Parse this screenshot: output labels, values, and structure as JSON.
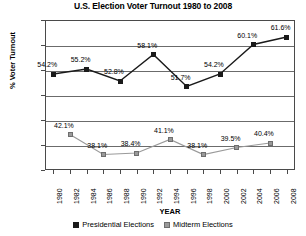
{
  "chart_data": {
    "type": "line",
    "title": "U.S. Election Voter Turnout 1980 to 2008",
    "xlabel": "YEAR",
    "ylabel": "% Voter Turnout",
    "ylim": [
      35,
      65
    ],
    "ytick_step": 5,
    "ytick_labels": [
      "65%",
      "60%",
      "55%",
      "50%",
      "45%",
      "40%",
      "35%"
    ],
    "ytick_values": [
      65,
      60,
      55,
      50,
      45,
      40,
      35
    ],
    "grid": true,
    "legend_position": "bottom",
    "x": [
      1980,
      1982,
      1984,
      1986,
      1988,
      1990,
      1992,
      1994,
      1996,
      1998,
      2000,
      2002,
      2004,
      2006,
      2008
    ],
    "xtick_labels": [
      "1980",
      "1982",
      "1984",
      "1986",
      "1988",
      "1990",
      "1992",
      "1994",
      "1996",
      "1998",
      "2000",
      "2002",
      "2004",
      "2006",
      "2008"
    ],
    "series": [
      {
        "name": "Presidential Elections",
        "color": "#1a1a1a",
        "points": [
          {
            "x": 1980,
            "y": 54.2,
            "label": "54.2%"
          },
          {
            "x": 1984,
            "y": 55.2,
            "label": "55.2%"
          },
          {
            "x": 1988,
            "y": 52.8,
            "label": "52.8%"
          },
          {
            "x": 1992,
            "y": 58.1,
            "label": "58.1%"
          },
          {
            "x": 1996,
            "y": 51.7,
            "label": "51.7%"
          },
          {
            "x": 2000,
            "y": 54.2,
            "label": "54.2%"
          },
          {
            "x": 2004,
            "y": 60.1,
            "label": "60.1%"
          },
          {
            "x": 2008,
            "y": 61.6,
            "label": "61.6%"
          }
        ]
      },
      {
        "name": "Midterm Elections",
        "color": "#9a9a9a",
        "points": [
          {
            "x": 1982,
            "y": 42.1,
            "label": "42.1%"
          },
          {
            "x": 1986,
            "y": 38.1,
            "label": "38.1%"
          },
          {
            "x": 1990,
            "y": 38.4,
            "label": "38.4%"
          },
          {
            "x": 1994,
            "y": 41.1,
            "label": "41.1%"
          },
          {
            "x": 1998,
            "y": 38.1,
            "label": "38.1%"
          },
          {
            "x": 2002,
            "y": 39.5,
            "label": "39.5%"
          },
          {
            "x": 2006,
            "y": 40.4,
            "label": "40.4%"
          }
        ]
      }
    ]
  },
  "legend": {
    "items": [
      {
        "label": "Presidential Elections"
      },
      {
        "label": "Midterm Elections"
      }
    ]
  }
}
